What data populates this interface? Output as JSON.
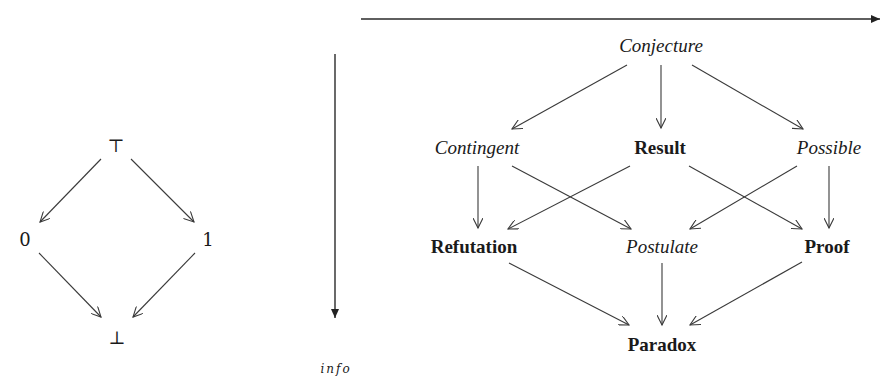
{
  "left_lattice": {
    "top": "⊤",
    "left": "0",
    "right": "1",
    "bottom": "⊥"
  },
  "axes": {
    "vertical_label": "info"
  },
  "right_lattice": {
    "top": "Conjecture",
    "mid_left": "Contingent",
    "mid_center": "Result",
    "mid_right": "Possible",
    "low_left": "Refutation",
    "low_center": "Postulate",
    "low_right": "Proof",
    "bottom": "Paradox"
  },
  "edges": [
    [
      "⊤",
      "0"
    ],
    [
      "⊤",
      "1"
    ],
    [
      "0",
      "⊥"
    ],
    [
      "1",
      "⊥"
    ],
    [
      "Conjecture",
      "Contingent"
    ],
    [
      "Conjecture",
      "Result"
    ],
    [
      "Conjecture",
      "Possible"
    ],
    [
      "Contingent",
      "Refutation"
    ],
    [
      "Contingent",
      "Postulate"
    ],
    [
      "Result",
      "Refutation"
    ],
    [
      "Result",
      "Proof"
    ],
    [
      "Possible",
      "Postulate"
    ],
    [
      "Possible",
      "Proof"
    ],
    [
      "Refutation",
      "Paradox"
    ],
    [
      "Postulate",
      "Paradox"
    ],
    [
      "Proof",
      "Paradox"
    ]
  ],
  "colors": {
    "line": "#3a3a3a",
    "text": "#1a1a1a"
  }
}
